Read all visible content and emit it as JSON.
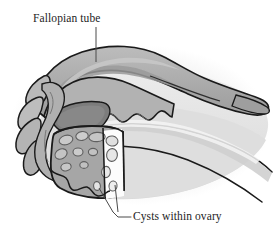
{
  "figure": {
    "kind": "anatomical-illustration",
    "background_color": "#ffffff",
    "outline_color": "#1a1a1a"
  },
  "labels": [
    {
      "id": "fallopian-tube",
      "text": "Fallopian tube",
      "x": 33,
      "y": 22,
      "anchor": "start",
      "leader": "vertical line descending from label to the tube wall"
    },
    {
      "id": "cysts-within-ovary",
      "text": "Cysts within ovary",
      "x": 133,
      "y": 220,
      "anchor": "start",
      "leader": "two lines converging from ovary cysts to an elbow, then horizontal to label"
    }
  ],
  "palette": {
    "outline": "#1a1a1a",
    "tube_upper": "#b4b4b4",
    "tube_mid": "#a2a2a2",
    "tube_shadow": "#8d8d8d",
    "ostium_dark": "#7e7e7e",
    "fimbriae": "#b9b9b9",
    "uterus_body": "#e4e4e4",
    "uterus_mid": "#d2d2d2",
    "ovary_stroma": "#a6a6a6",
    "cyst_fill": "#c9c9c9",
    "cut_surface": "#fbfbfb",
    "halo": "#ededed",
    "leader_line": "#4a4a4a"
  },
  "regions": [
    {
      "id": "fallopian-tube-body",
      "name": "fallopian tube",
      "shade": "#a8a8a8"
    },
    {
      "id": "fimbriae",
      "name": "fimbriae",
      "shade": "#b9b9b9"
    },
    {
      "id": "tubal-ostium",
      "name": "tubal ostium opening",
      "shade": "#7e7e7e"
    },
    {
      "id": "ovary",
      "name": "ovary with cysts",
      "shade": "#a6a6a6"
    },
    {
      "id": "ovary-cut-surface",
      "name": "cut surface of ovary",
      "shade": "#fbfbfb"
    },
    {
      "id": "uterine-body",
      "name": "uterine body",
      "shade": "#e4e4e4"
    }
  ],
  "cysts": [
    {
      "cx": 66,
      "cy": 140,
      "rx": 7.0,
      "ry": 4.6,
      "rot": -16
    },
    {
      "cx": 82,
      "cy": 136,
      "rx": 6.2,
      "ry": 4.4,
      "rot": -8
    },
    {
      "cx": 97,
      "cy": 137,
      "rx": 8.2,
      "ry": 4.6,
      "rot": -4
    },
    {
      "cx": 112,
      "cy": 141,
      "rx": 6.0,
      "ry": 5.0,
      "rot": 10
    },
    {
      "cx": 61,
      "cy": 154,
      "rx": 6.4,
      "ry": 4.8,
      "rot": -28
    },
    {
      "cx": 78,
      "cy": 152,
      "rx": 5.0,
      "ry": 4.0,
      "rot": 0
    },
    {
      "cx": 93,
      "cy": 152,
      "rx": 4.6,
      "ry": 3.6,
      "rot": 0
    },
    {
      "cx": 112,
      "cy": 155,
      "rx": 5.4,
      "ry": 6.4,
      "rot": 6
    },
    {
      "cx": 66,
      "cy": 167,
      "rx": 5.2,
      "ry": 3.8,
      "rot": -12
    },
    {
      "cx": 84,
      "cy": 165,
      "rx": 4.2,
      "ry": 3.4,
      "rot": 0
    },
    {
      "cx": 106,
      "cy": 172,
      "rx": 4.4,
      "ry": 5.6,
      "rot": 4
    },
    {
      "cx": 113,
      "cy": 186,
      "rx": 4.0,
      "ry": 5.0,
      "rot": 8
    },
    {
      "cx": 97,
      "cy": 186,
      "rx": 3.4,
      "ry": 4.4,
      "rot": -6
    }
  ]
}
